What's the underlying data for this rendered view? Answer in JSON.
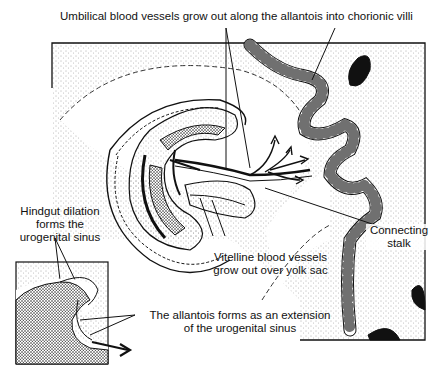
{
  "diagram": {
    "type": "embryology illustration",
    "labels": {
      "umbilical": "Umbilical blood vessels grow out along the allantois into chorionic villi",
      "hindgut_1": "Hindgut dilation",
      "hindgut_2": "forms the",
      "hindgut_3": "urogenital sinus",
      "vitelline_1": "Vitelline blood vessels",
      "vitelline_2": "grow out over yolk sac",
      "stalk_1": "Connecting",
      "stalk_2": "stalk",
      "allantois_1": "The allantois forms as an extension",
      "allantois_2": "of the urogenital sinus"
    },
    "colors": {
      "ink": "#111111",
      "background": "#ffffff",
      "stipple": "#555555"
    }
  }
}
